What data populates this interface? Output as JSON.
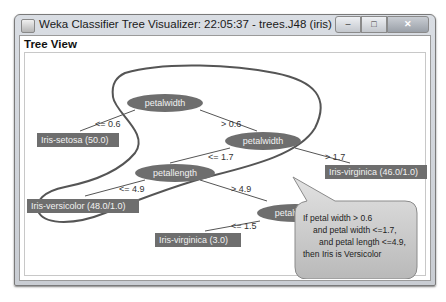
{
  "window": {
    "title": "Weka Classifier Tree Visualizer: 22:05:37 - trees.J48 (iris)",
    "controls": {
      "minimize": "–",
      "maximize": "□",
      "close": "✕"
    }
  },
  "panel": {
    "title": "Tree View"
  },
  "tree": {
    "nodes": [
      {
        "id": "root",
        "label": "petalwidth"
      },
      {
        "id": "n2",
        "label": "petalwidth"
      },
      {
        "id": "n3",
        "label": "petallength"
      },
      {
        "id": "n4",
        "label": "petalwidth"
      }
    ],
    "leaves": [
      {
        "id": "l1",
        "label": "Iris-setosa (50.0)"
      },
      {
        "id": "l2",
        "label": "Iris-virginica (46.0/1.0)"
      },
      {
        "id": "l3",
        "label": "Iris-versicolor (48.0/1.0)"
      },
      {
        "id": "l4",
        "label": "Iris-virginica (3.0)"
      }
    ],
    "edges": [
      {
        "label": "<= 0.6"
      },
      {
        "label": "> 0.6"
      },
      {
        "label": "<= 1.7"
      },
      {
        "label": "> 1.7"
      },
      {
        "label": "<= 4.9"
      },
      {
        "label": "> 4.9"
      },
      {
        "label": "<= 1.5"
      }
    ]
  },
  "callout": {
    "lines": [
      "If petal width > 0.6",
      "and petal width <=1.7,",
      "and petal length <=4.9,",
      "then Iris is Versicolor"
    ]
  },
  "colors": {
    "node": "#6e6e6e",
    "outline": "#555555",
    "callout": "#c8c8c8"
  }
}
